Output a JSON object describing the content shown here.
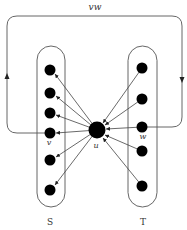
{
  "diagram": {
    "type": "directed-graph",
    "colors": {
      "stroke": "#444444",
      "node": "#000000",
      "text": "#333333",
      "background": "#ffffff"
    },
    "labels": {
      "loop": "vw",
      "u": "u",
      "v": "v",
      "w": "w",
      "set_s": "S",
      "set_t": "T"
    },
    "sets": [
      {
        "name": "S",
        "nodes": [
          {
            "x": 50,
            "y": 70
          },
          {
            "x": 50,
            "y": 93
          },
          {
            "x": 50,
            "y": 113
          },
          {
            "x": 50,
            "y": 133,
            "label": "v"
          },
          {
            "x": 50,
            "y": 160
          },
          {
            "x": 50,
            "y": 190
          }
        ]
      },
      {
        "name": "T",
        "nodes": [
          {
            "x": 142,
            "y": 68
          },
          {
            "x": 142,
            "y": 99
          },
          {
            "x": 142,
            "y": 127,
            "label": "w"
          },
          {
            "x": 142,
            "y": 151
          },
          {
            "x": 142,
            "y": 186
          }
        ]
      }
    ],
    "center": {
      "name": "u",
      "x": 97,
      "y": 130
    },
    "edges": {
      "u_to_S": "u points to every vertex in S",
      "T_to_u": "every vertex in T points to u",
      "loop": "v to w via outer rectangular path labeled vw"
    }
  }
}
